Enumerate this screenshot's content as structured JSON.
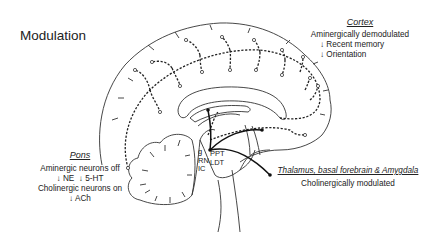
{
  "title": "Modulation",
  "cortex": {
    "heading": "Cortex",
    "status": "Aminergically demodulated",
    "effects": [
      "↓ Recent memory",
      "↓ Orientation"
    ]
  },
  "pons": {
    "heading": "Pons",
    "line1": "Aminergic neurons off",
    "line2": "↓ NE  ↓ 5-HT",
    "line3": "Cholinergic neurons on",
    "line4": "↓ ACh"
  },
  "thalamus": {
    "heading": "Thalamus, basal forebrain & Amygdala",
    "status": "Cholinergically modulated"
  },
  "nuclei": {
    "left": [
      "g",
      "RN",
      "IC"
    ],
    "right": [
      "PPT",
      "LDT"
    ]
  }
}
